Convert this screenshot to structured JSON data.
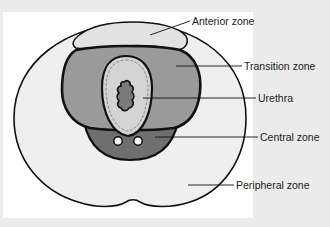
{
  "diagram": {
    "labels": {
      "anterior": "Anterior zone",
      "transition": "Transition zone",
      "urethra": "Urethra",
      "central": "Central zone",
      "peripheral": "Peripheral zone"
    },
    "colors": {
      "background": "#ebebeb",
      "panel": "#ffffff",
      "peripheral_fill": "#efefef",
      "anterior_fill": "#e2e2e2",
      "transition_fill": "#9a9a9a",
      "urethra_fill": "#d4d4d4",
      "central_fill": "#6f6f6f",
      "lumen_fill": "#7a7a7a",
      "outline": "#111111"
    }
  }
}
